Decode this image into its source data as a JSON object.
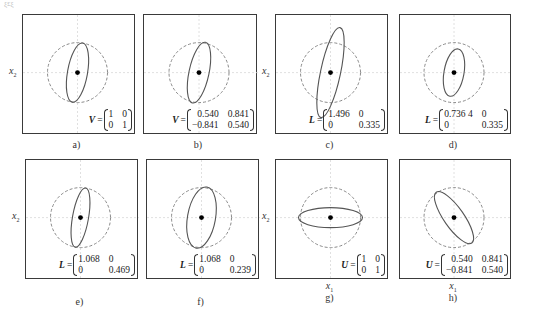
{
  "figure": {
    "corner_text": "ξ£ξ",
    "y_axis_label": "x",
    "y_axis_sub": "2",
    "x_axis_label": "x",
    "x_axis_sub": "1",
    "colors": {
      "frame": "#3a3a3a",
      "circle": "#8a8a8a",
      "ellipse": "#555555",
      "axes": "#d8d8d8",
      "dot": "#000000"
    }
  },
  "panels": [
    {
      "id": "a",
      "caption": "a)",
      "x": 22,
      "y": 14,
      "w": 113,
      "h": 120,
      "show_ylabel": true,
      "show_xlabel": false,
      "ellipse": {
        "rx": 10,
        "ry": 30,
        "rot": 10,
        "cx": 0,
        "cy": 0
      },
      "matrix": {
        "symbol": "V",
        "rows": [
          [
            "1",
            "0"
          ],
          [
            "0",
            "1"
          ]
        ],
        "align": "left"
      }
    },
    {
      "id": "b",
      "caption": "b)",
      "x": 143,
      "y": 14,
      "w": 114,
      "h": 120,
      "show_ylabel": false,
      "show_xlabel": false,
      "ellipse": {
        "rx": 10,
        "ry": 31,
        "rot": 12,
        "cx": 0,
        "cy": 0
      },
      "matrix": {
        "symbol": "V",
        "rows": [
          [
            "0.540",
            "0.841"
          ],
          [
            "−0.841",
            "0.540"
          ]
        ],
        "align": "right"
      }
    },
    {
      "id": "c",
      "caption": "c)",
      "x": 275,
      "y": 14,
      "w": 113,
      "h": 120,
      "show_ylabel": true,
      "show_xlabel": false,
      "ellipse": {
        "rx": 10,
        "ry": 46,
        "rot": 12,
        "cx": 0,
        "cy": 0
      },
      "matrix": {
        "symbol": "L",
        "rows": [
          [
            "1.496",
            "0"
          ],
          [
            "0",
            "0.335"
          ]
        ],
        "align": "left"
      }
    },
    {
      "id": "d",
      "caption": "d)",
      "x": 399,
      "y": 14,
      "w": 112,
      "h": 120,
      "show_ylabel": false,
      "show_xlabel": false,
      "ellipse": {
        "rx": 10,
        "ry": 24,
        "rot": 10,
        "cx": 0,
        "cy": 0
      },
      "matrix": {
        "symbol": "L",
        "rows": [
          [
            "0.736 4",
            "0"
          ],
          [
            "0",
            "0.335"
          ]
        ],
        "align": "left"
      }
    },
    {
      "id": "e",
      "caption": "e)",
      "x": 25,
      "y": 159,
      "w": 113,
      "h": 120,
      "show_ylabel": true,
      "show_xlabel": false,
      "ellipse": {
        "rx": 8,
        "ry": 30,
        "rot": 10,
        "cx": 0,
        "cy": 0
      },
      "matrix": {
        "symbol": "L",
        "rows": [
          [
            "1.068",
            "0"
          ],
          [
            "0",
            "0.469"
          ]
        ],
        "align": "left"
      }
    },
    {
      "id": "f",
      "caption": "f)",
      "x": 146,
      "y": 159,
      "w": 113,
      "h": 120,
      "show_ylabel": false,
      "show_xlabel": false,
      "ellipse": {
        "rx": 14,
        "ry": 31,
        "rot": 10,
        "cx": 0,
        "cy": 0
      },
      "matrix": {
        "symbol": "L",
        "rows": [
          [
            "1.068",
            "0"
          ],
          [
            "0",
            "0.239"
          ]
        ],
        "align": "left"
      }
    },
    {
      "id": "g",
      "caption": "g)",
      "x": 275,
      "y": 159,
      "w": 113,
      "h": 120,
      "show_ylabel": true,
      "show_xlabel": true,
      "ellipse": {
        "rx": 32,
        "ry": 10,
        "rot": 0,
        "cx": 0,
        "cy": 0
      },
      "matrix": {
        "symbol": "U",
        "rows": [
          [
            "1",
            "0"
          ],
          [
            "0",
            "1"
          ]
        ],
        "align": "left"
      }
    },
    {
      "id": "h",
      "caption": "h)",
      "x": 399,
      "y": 159,
      "w": 112,
      "h": 120,
      "show_ylabel": false,
      "show_xlabel": true,
      "ellipse": {
        "rx": 10,
        "ry": 31,
        "rot": -35,
        "cx": 0,
        "cy": 0
      },
      "matrix": {
        "symbol": "U",
        "rows": [
          [
            "0.540",
            "0.841"
          ],
          [
            "−0.841",
            "0.540"
          ]
        ],
        "align": "right"
      }
    }
  ]
}
